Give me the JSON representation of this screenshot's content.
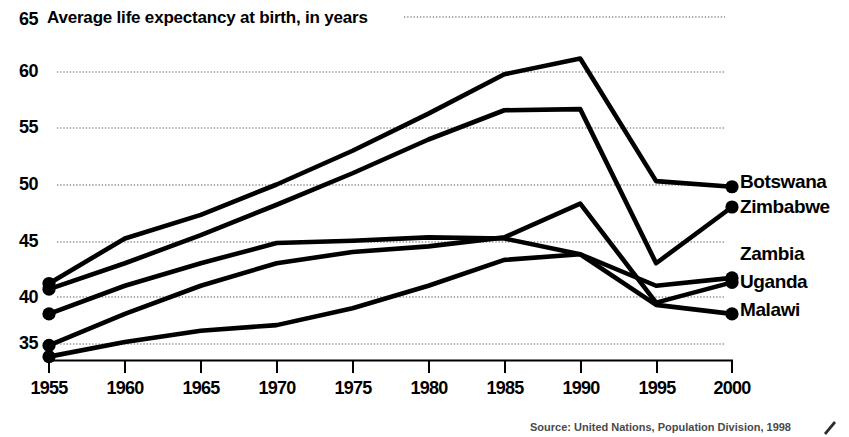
{
  "chart_data": {
    "type": "line",
    "title": "Average life expectancy at birth, in years",
    "xlabel": "",
    "ylabel": "",
    "xlim": [
      1955,
      2000
    ],
    "ylim": [
      33,
      65
    ],
    "grid": true,
    "grid_style": "dotted-horizontal",
    "legend_position": "right-of-line-ends",
    "x": [
      1955,
      1960,
      1965,
      1970,
      1975,
      1980,
      1985,
      1990,
      1995,
      2000
    ],
    "xtick_labels": [
      "1955",
      "1960",
      "1965",
      "1970",
      "1975",
      "1980",
      "1985",
      "1990",
      "1995",
      "2000"
    ],
    "ytick_labels": [
      "35",
      "40",
      "45",
      "50",
      "55",
      "60",
      "65"
    ],
    "ytick_values": [
      35,
      40,
      45,
      50,
      55,
      60,
      65
    ],
    "series": [
      {
        "name": "Botswana",
        "values": [
          41.2,
          45.2,
          47.3,
          50.0,
          53.0,
          56.3,
          59.8,
          61.2,
          50.3,
          49.8
        ],
        "marker_start": true,
        "marker_end": true
      },
      {
        "name": "Zimbabwe",
        "values": [
          40.7,
          43.0,
          45.5,
          48.2,
          51.0,
          54.0,
          56.6,
          56.7,
          43.0,
          48.0
        ],
        "marker_start": true,
        "marker_end": true
      },
      {
        "name": "Zambia",
        "values": [
          38.5,
          41.0,
          43.0,
          44.8,
          45.0,
          45.3,
          45.2,
          43.8,
          41.0,
          41.7
        ],
        "marker_start": true,
        "marker_end": true
      },
      {
        "name": "Uganda",
        "values": [
          35.7,
          38.5,
          41.0,
          43.0,
          44.0,
          44.5,
          45.3,
          48.3,
          39.5,
          41.3
        ],
        "marker_start": true,
        "marker_end": true
      },
      {
        "name": "Malawi",
        "values": [
          34.7,
          36.0,
          37.0,
          37.5,
          39.0,
          41.0,
          43.3,
          43.8,
          39.3,
          38.5
        ],
        "marker_start": true,
        "marker_end": true
      }
    ],
    "line_color": "#000000",
    "grid_color": "#8c8c8c",
    "source": "Source: United Nations, Population Division, 1998"
  },
  "legend": {
    "items": [
      {
        "label": "Botswana"
      },
      {
        "label": "Zimbabwe"
      },
      {
        "label": "Zambia"
      },
      {
        "label": "Uganda"
      },
      {
        "label": "Malawi"
      }
    ]
  }
}
